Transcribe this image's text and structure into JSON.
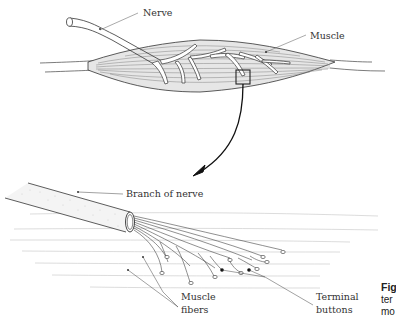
{
  "figure": {
    "top_panel": {
      "labels": {
        "nerve": "Nerve",
        "muscle": "Muscle"
      }
    },
    "bottom_panel": {
      "labels": {
        "branch_of_nerve": "Branch of nerve",
        "muscle_fibers_line1": "Muscle",
        "muscle_fibers_line2": "fibers",
        "terminal_buttons_line1": "Terminal",
        "terminal_buttons_line2": "buttons"
      }
    },
    "caption_fragment": {
      "line1": "Fig",
      "line2": "ter",
      "line3": "mo"
    },
    "colors": {
      "ink": "#222222",
      "muscle_fill": "#e4e4e4",
      "fiber_lines": "#c8c8c8"
    }
  }
}
